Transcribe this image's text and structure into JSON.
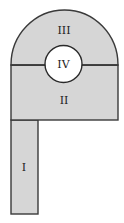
{
  "diagram": {
    "type": "composite-region-figure",
    "colors": {
      "fill": "#d6d6d6",
      "stroke": "#3a3a3a",
      "hole": "#ffffff",
      "text": "#222222"
    },
    "regions": [
      {
        "id": "I",
        "label": "I",
        "shape": "rectangle",
        "note": "tall narrow strip at bottom-left"
      },
      {
        "id": "II",
        "label": "II",
        "shape": "rectangle",
        "note": "wide rectangle below the divider"
      },
      {
        "id": "III",
        "label": "III",
        "shape": "semicircle",
        "note": "half-disc on top"
      },
      {
        "id": "IV",
        "label": "IV",
        "shape": "circle",
        "note": "unshaded circular hole centered on the divider"
      }
    ]
  }
}
